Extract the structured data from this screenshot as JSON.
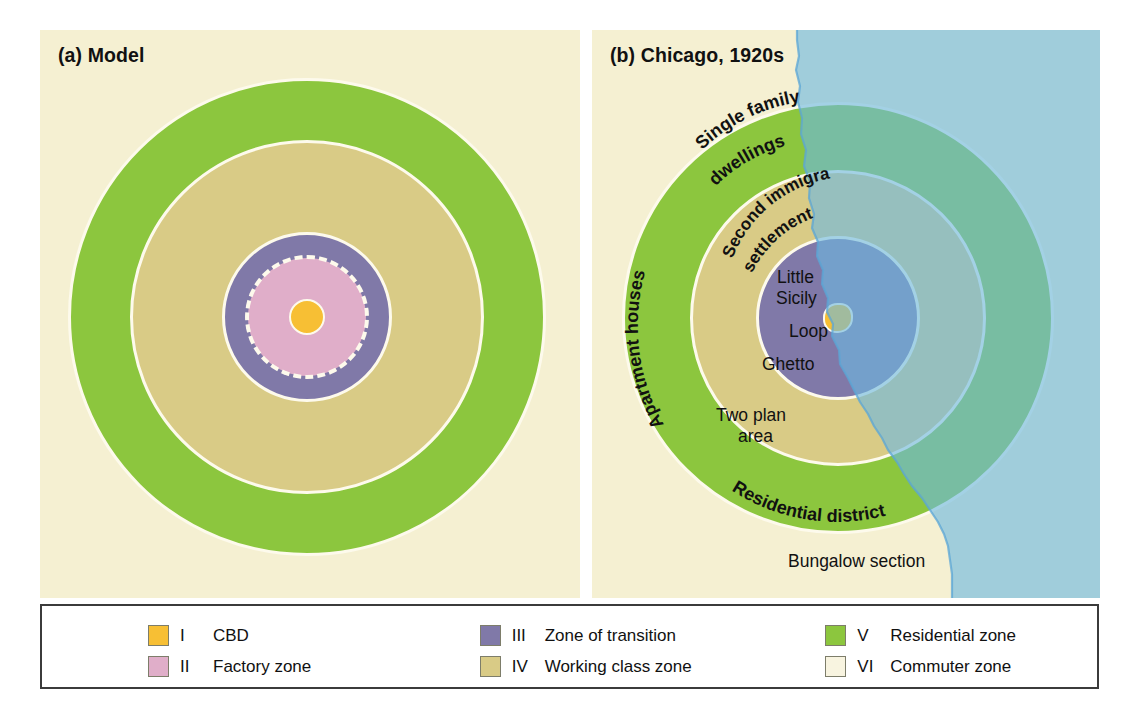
{
  "figure": {
    "background": "#ffffff",
    "panel_background": "#f5f0d2"
  },
  "panels": [
    {
      "id": "model",
      "title": "(a) Model",
      "labels": []
    },
    {
      "id": "chicago",
      "title": "(b) Chicago, 1920s",
      "labels": [
        {
          "name": "single-family-dwellings",
          "text": "Single family dwellings"
        },
        {
          "name": "second-immigrant-settlement",
          "text": "Second immigrant settlement"
        },
        {
          "name": "apartment-houses",
          "text": "Apartment houses"
        },
        {
          "name": "little-sicily",
          "text": "Little"
        },
        {
          "name": "little-sicily-2",
          "text": "Sicily"
        },
        {
          "name": "loop",
          "text": "Loop"
        },
        {
          "name": "ghetto",
          "text": "Ghetto"
        },
        {
          "name": "two-plan-area",
          "text": "Two plan"
        },
        {
          "name": "two-plan-area-2",
          "text": "area"
        },
        {
          "name": "residential-district",
          "text": "Residential district"
        },
        {
          "name": "bungalow-section",
          "text": "Bungalow section"
        }
      ]
    }
  ],
  "chicago_text": {
    "single_family": "Single family",
    "dwellings": "dwellings",
    "second_immigrant": "Second immigrant",
    "settlement": "settlement",
    "apartment_houses": "Apartment houses",
    "little": "Little",
    "sicily": "Sicily",
    "loop": "Loop",
    "ghetto": "Ghetto",
    "two_plan": "Two plan",
    "area": "area",
    "residential_district": "Residential district",
    "bungalow_section": "Bungalow section"
  },
  "colors": {
    "cbd": "#f7bf34",
    "factory": "#e0aec9",
    "transition": "#8079a8",
    "working_class": "#d9cb86",
    "residential": "#8cc63e",
    "commuter": "#f5f0d2",
    "lake": "#8fcdeb",
    "ring_stroke": "#fdfaec",
    "legend_border": "#3b3b3b"
  },
  "legend": {
    "columns": [
      {
        "items": [
          {
            "numeral": "I",
            "label": "CBD",
            "color": "#f7bf34",
            "swatch_name": "legend-swatch-cbd"
          },
          {
            "numeral": "II",
            "label": "Factory zone",
            "color": "#e0aec9",
            "swatch_name": "legend-swatch-factory"
          }
        ]
      },
      {
        "items": [
          {
            "numeral": "III",
            "label": "Zone of transition",
            "color": "#8079a8",
            "swatch_name": "legend-swatch-transition"
          },
          {
            "numeral": "IV",
            "label": "Working class zone",
            "color": "#d9cb86",
            "swatch_name": "legend-swatch-working-class"
          }
        ]
      },
      {
        "items": [
          {
            "numeral": "V",
            "label": "Residential zone",
            "color": "#8cc63e",
            "swatch_name": "legend-swatch-residential"
          },
          {
            "numeral": "VI",
            "label": "Commuter zone",
            "color": "#f8f4e0",
            "swatch_name": "legend-swatch-commuter"
          }
        ]
      }
    ]
  }
}
